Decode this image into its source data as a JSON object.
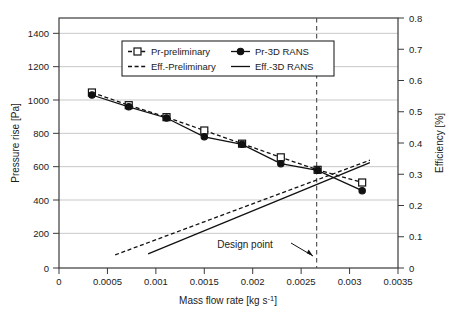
{
  "chart_data": {
    "type": "line",
    "title": "",
    "xlabel": "Mass flow rate [kg s-1]",
    "xlabel_base": "Mass flow rate [kg s",
    "xlabel_sup": "-1",
    "xlabel_tail": "]",
    "ylabel_left": "Pressure rise [Pa]",
    "ylabel_right": "Efficiency [%]",
    "xlim": [
      0,
      0.0035
    ],
    "ylim_left": [
      0,
      1500
    ],
    "ylim_right": [
      0,
      0.8
    ],
    "grid": "horizontal",
    "legend_position": "top-center",
    "x_ticks": [
      "0",
      "0.0005",
      "0.001",
      "0.0015",
      "0.002",
      "0.0025",
      "0.003",
      "0.0035"
    ],
    "x_tick_values": [
      0,
      0.0005,
      0.001,
      0.0015,
      0.002,
      0.0025,
      0.003,
      0.0035
    ],
    "y_ticks_left": [
      "0",
      "200",
      "400",
      "600",
      "800",
      "1000",
      "1200",
      "1400"
    ],
    "y_tick_values_left": [
      0,
      200,
      400,
      600,
      800,
      1000,
      1200,
      1400
    ],
    "y_ticks_right": [
      "0",
      "0.1",
      "0.2",
      "0.3",
      "0.4",
      "0.5",
      "0.6",
      "0.7",
      "0.8"
    ],
    "y_tick_values_right": [
      0,
      0.1,
      0.2,
      0.3,
      0.4,
      0.5,
      0.6,
      0.7,
      0.8
    ],
    "annotations": [
      {
        "text": "Design point",
        "x": 0.00211,
        "y": 95,
        "arrow_to_x": 0.00266,
        "arrow_to_y": 25
      }
    ],
    "reference_lines": [
      {
        "name": "design-point-line",
        "orientation": "vertical",
        "x": 0.00266,
        "style": "dashed"
      }
    ],
    "series": [
      {
        "name": "Pr-preliminary",
        "axis": "left",
        "style": "dashed",
        "marker": "open-square",
        "x": [
          0.00034,
          0.00072,
          0.00111,
          0.0015,
          0.00189,
          0.00229,
          0.00267,
          0.00313
        ],
        "y": [
          1053,
          977,
          905,
          825,
          746,
          664,
          589,
          513
        ]
      },
      {
        "name": "Pr-3D RANS",
        "axis": "left",
        "style": "solid",
        "marker": "filled-circle",
        "x": [
          0.00034,
          0.00072,
          0.00111,
          0.0015,
          0.00189,
          0.00229,
          0.00267,
          0.00313
        ],
        "y": [
          1038,
          967,
          900,
          787,
          742,
          626,
          586,
          464
        ]
      },
      {
        "name": "Eff.-Preliminary",
        "axis": "right",
        "style": "dashed",
        "marker": "none",
        "x": [
          0.00058,
          0.00321
        ],
        "y": [
          0.042,
          0.345
        ]
      },
      {
        "name": "Eff.-3D RANS",
        "axis": "right",
        "style": "solid",
        "marker": "none",
        "x": [
          0.00092,
          0.00321
        ],
        "y": [
          0.045,
          0.337
        ]
      }
    ],
    "legend": [
      {
        "label": "Pr-preliminary",
        "style": "dashed",
        "marker": "open-square"
      },
      {
        "label": "Pr-3D RANS",
        "style": "solid",
        "marker": "filled-circle"
      },
      {
        "label": "Eff.-Preliminary",
        "style": "dashed",
        "marker": "none"
      },
      {
        "label": "Eff.-3D RANS",
        "style": "solid",
        "marker": "none"
      }
    ]
  }
}
